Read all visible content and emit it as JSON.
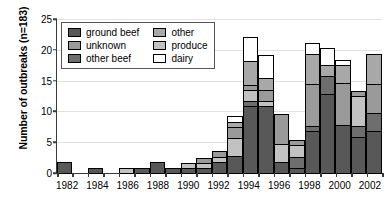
{
  "chart_data": {
    "type": "bar",
    "subtype": "stacked-vertical",
    "title": "",
    "xlabel": "",
    "ylabel": "Number of outbreaks (n=183)",
    "ylim": [
      0,
      25
    ],
    "yticks": [
      0,
      5,
      10,
      15,
      20,
      25
    ],
    "grid": true,
    "grid_axis": "y",
    "legend_position": "upper-left-inside",
    "x": [
      1982,
      1983,
      1984,
      1985,
      1986,
      1987,
      1988,
      1989,
      1990,
      1991,
      1992,
      1993,
      1994,
      1995,
      1996,
      1997,
      1998,
      1999,
      2000,
      2001,
      2002
    ],
    "xtick_labels": [
      "1982",
      "",
      "1984",
      "",
      "1986",
      "",
      "1988",
      "",
      "1990",
      "",
      "1992",
      "",
      "1994",
      "",
      "1996",
      "",
      "1998",
      "",
      "2000",
      "",
      "2002"
    ],
    "categories": [
      "1982",
      "1983",
      "1984",
      "1985",
      "1986",
      "1987",
      "1988",
      "1989",
      "1990",
      "1991",
      "1992",
      "1993",
      "1994",
      "1995",
      "1996",
      "1997",
      "1998",
      "1999",
      "2000",
      "2001",
      "2002"
    ],
    "series": [
      {
        "name": "ground beef",
        "color": "#585858",
        "values": [
          2,
          0,
          1,
          0,
          0,
          1,
          2,
          1,
          1,
          1,
          2,
          3,
          11,
          11,
          2,
          1,
          7,
          13,
          8,
          6,
          7
        ]
      },
      {
        "name": "other beef",
        "color": "#6e6e6e",
        "values": [
          0,
          0,
          0,
          0,
          0,
          0,
          0,
          0,
          0,
          0,
          0,
          0,
          1,
          0,
          0,
          2,
          1,
          3,
          0,
          2,
          3
        ]
      },
      {
        "name": "produce",
        "color": "#c2c2c2",
        "values": [
          0,
          0,
          0,
          0,
          1,
          0,
          0,
          0,
          1,
          1,
          1,
          3,
          2,
          1,
          3,
          2,
          0,
          0,
          0,
          5,
          0
        ]
      },
      {
        "name": "unknown",
        "color": "#9a9a9a",
        "values": [
          0,
          0,
          0,
          0,
          0,
          0,
          0,
          0,
          0,
          1,
          1,
          2,
          1,
          2,
          5,
          1,
          7,
          0,
          7,
          1,
          5
        ]
      },
      {
        "name": "other",
        "color": "#a8a8a8",
        "values": [
          0,
          0,
          0,
          0,
          0,
          0,
          0,
          0,
          0,
          0,
          0,
          1,
          4,
          2,
          0,
          0,
          5,
          2,
          3,
          0,
          5
        ]
      },
      {
        "name": "dairy",
        "color": "#ffffff",
        "values": [
          0,
          0,
          0,
          0,
          0,
          0,
          0,
          0,
          0,
          0,
          0,
          1,
          4,
          4,
          0,
          0,
          2,
          3,
          1,
          0,
          0
        ]
      }
    ],
    "totals": [
      2,
      0,
      1,
      0,
      1,
      1,
      2,
      1,
      2,
      3,
      4,
      10,
      23,
      20,
      10,
      6,
      22,
      21,
      19,
      14,
      20
    ],
    "annotations": []
  },
  "legend": {
    "entries": [
      {
        "label": "ground beef",
        "swatch": "#585858",
        "icon": "legend-swatch"
      },
      {
        "label": "other",
        "swatch": "#a8a8a8",
        "icon": "legend-swatch"
      },
      {
        "label": "unknown",
        "swatch": "#9a9a9a",
        "icon": "legend-swatch"
      },
      {
        "label": "produce",
        "swatch": "#c2c2c2",
        "icon": "legend-swatch"
      },
      {
        "label": "other beef",
        "swatch": "#6e6e6e",
        "icon": "legend-swatch"
      },
      {
        "label": "dairy",
        "swatch": "#ffffff",
        "icon": "legend-swatch"
      }
    ]
  }
}
